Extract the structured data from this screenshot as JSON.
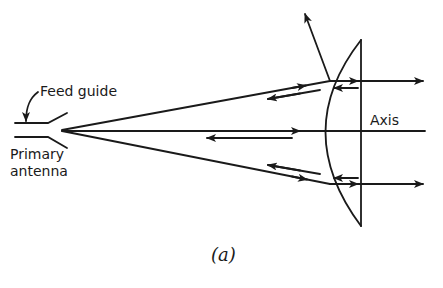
{
  "diagram": {
    "type": "lens antenna ray diagram",
    "labels": {
      "feed_guide": "Feed guide",
      "primary_antenna_line1": "Primary",
      "primary_antenna_line2": "antenna",
      "axis": "Axis",
      "caption": "(a)"
    },
    "colors": {
      "ink": "#1a1a1a",
      "background": "#ffffff"
    },
    "elements": [
      "feed waveguide (horn) at left",
      "three rays diverging from feed apex to lens",
      "plano-convex lens (curved surface facing feed, flat face at right)",
      "transmitted parallel rays exiting right",
      "reflected rays returning toward feed (short arrows pointing left)",
      "one ray reflected upward-left from the upper lens surface"
    ]
  }
}
